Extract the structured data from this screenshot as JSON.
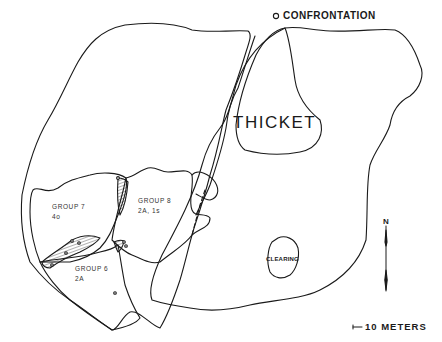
{
  "map": {
    "labels": {
      "confrontation": "CONFRONTATION",
      "thicket": "THICKET",
      "clearing": "CLEARING",
      "north": "N",
      "scale": "10 METERS"
    },
    "groups": [
      {
        "name": "GROUP 7",
        "composition": "4o"
      },
      {
        "name": "GROUP 8",
        "composition": "2A, 1s"
      },
      {
        "name": "GROUP 6",
        "composition": "2A"
      }
    ],
    "icons": {
      "confrontation_marker": "open-circle",
      "north_arrow": "north-arrow",
      "scale_bar": "scale-bar"
    },
    "colors": {
      "ink": "#1a1a1a",
      "background": "#ffffff"
    }
  }
}
